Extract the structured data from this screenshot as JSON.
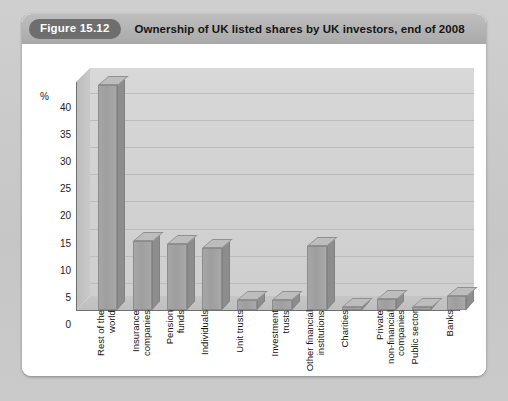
{
  "figure": {
    "badge": "Figure 15.12",
    "title": "Ownership of UK listed shares by UK investors, end of 2008"
  },
  "chart_data": {
    "type": "bar",
    "title": "Ownership of UK listed shares by UK investors, end of 2008",
    "xlabel": "",
    "ylabel": "%",
    "ylim": [
      0,
      42
    ],
    "yticks": [
      0,
      5,
      10,
      15,
      20,
      25,
      30,
      35,
      40
    ],
    "grid": true,
    "legend": false,
    "categories": [
      "Rest of the\nworld",
      "Insurance\ncompanies",
      "Pension\nfunds",
      "Individuals",
      "Unit trusts",
      "Investment\ntrusts",
      "Other financial\ninstitutions",
      "Charities",
      "Private\nnon-financial\ncompanies",
      "Public sector",
      "Banks"
    ],
    "values": [
      41.5,
      12.8,
      12.1,
      11.5,
      1.8,
      1.8,
      11.7,
      0.6,
      2.0,
      0.6,
      2.5
    ],
    "bar_color": "#9e9e9e",
    "plot_background": "#d4d4d4",
    "gridline_color": "#bcbcbc"
  }
}
